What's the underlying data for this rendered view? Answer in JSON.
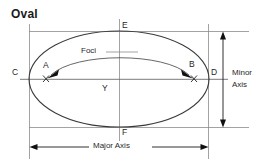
{
  "title": "Oval",
  "labels": {
    "point_a": "A",
    "point_b": "B",
    "point_c": "C",
    "point_d": "D",
    "point_e": "E",
    "point_f": "F",
    "center": "Y",
    "focus_left_marker": "X",
    "focus_right_marker": "X",
    "foci": "Foci",
    "major_axis": "Major Axis",
    "minor_axis_line1": "Minor",
    "minor_axis_line2": "Axis"
  },
  "colors": {
    "background": "#ffffff",
    "ink": "#1f1f1f",
    "outline": "#3a3a3a",
    "guide": "#8c8c8c",
    "dimension": "#1a1a1a"
  },
  "geometry": {
    "ellipse_center_x": 119,
    "ellipse_center_y": 79,
    "ellipse_radius_x": 90,
    "ellipse_radius_y": 48,
    "focus_left_x": 46,
    "focus_right_x": 194,
    "major_axis_y": 79,
    "minor_axis_x": 119
  }
}
